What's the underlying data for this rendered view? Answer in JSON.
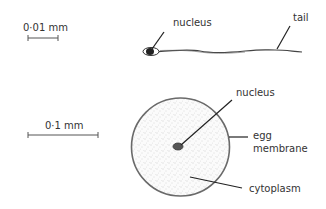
{
  "sperm": {
    "scale_label": "0·01 mm",
    "labels": {
      "nucleus": "nucleus",
      "tail": "tail"
    }
  },
  "egg": {
    "scale_label": "0·1 mm",
    "labels": {
      "nucleus": "nucleus",
      "membrane_line1": "egg",
      "membrane_line2": "membrane",
      "cytoplasm": "cytoplasm"
    }
  },
  "colors": {
    "ink": "#222222",
    "outline": "#666666",
    "stipple": "#999999"
  }
}
